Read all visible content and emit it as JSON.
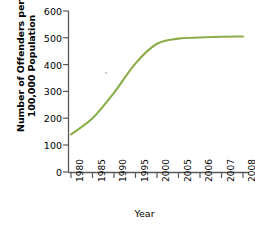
{
  "chart_data": {
    "type": "line",
    "title": "",
    "xlabel": "Year",
    "ylabel_line1": "Number of Offenders per",
    "ylabel_line2": "100,000 Population",
    "categories": [
      "1980",
      "1985",
      "1990",
      "1995",
      "2000",
      "2005",
      "2006",
      "2007",
      "2008"
    ],
    "values": [
      140,
      200,
      295,
      405,
      478,
      497,
      501,
      504,
      505
    ],
    "series": [
      {
        "name": "Offenders per 100,000 Population",
        "values": [
          140,
          200,
          295,
          405,
          478,
          497,
          501,
          504,
          505
        ]
      }
    ],
    "ylim": [
      0,
      600
    ],
    "yticks": [
      "0",
      "100",
      "200",
      "300",
      "400",
      "500",
      "600"
    ],
    "ytick_values": [
      0,
      100,
      200,
      300,
      400,
      500,
      600
    ],
    "grid": false,
    "legend": false,
    "line_color": "#8aad4a",
    "axis_color": "#58595b",
    "xtick_rotation": "vertical",
    "marker": "none"
  }
}
